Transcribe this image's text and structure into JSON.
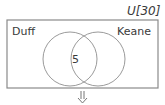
{
  "venn": {
    "universe_label": "U[30]",
    "set_a": "Duff",
    "set_b": "Keane",
    "intersection": "5",
    "arrow": "down-arrow"
  },
  "colors": {
    "stroke": "#8a8a8a",
    "text": "#3a3a3a"
  }
}
